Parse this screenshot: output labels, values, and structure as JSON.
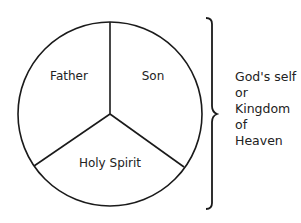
{
  "diagram": {
    "type": "trinity-circle-diagram",
    "segments": [
      {
        "label": "Father",
        "position": "upper-left"
      },
      {
        "label": "Son",
        "position": "upper-right"
      },
      {
        "label": "Holy Spirit",
        "position": "bottom"
      }
    ],
    "brace_label_lines": [
      "God's self",
      "or",
      "Kingdom",
      "of",
      "Heaven"
    ],
    "colors": {
      "stroke": "#1a1a1a",
      "text": "#222222",
      "background": "#ffffff"
    }
  }
}
